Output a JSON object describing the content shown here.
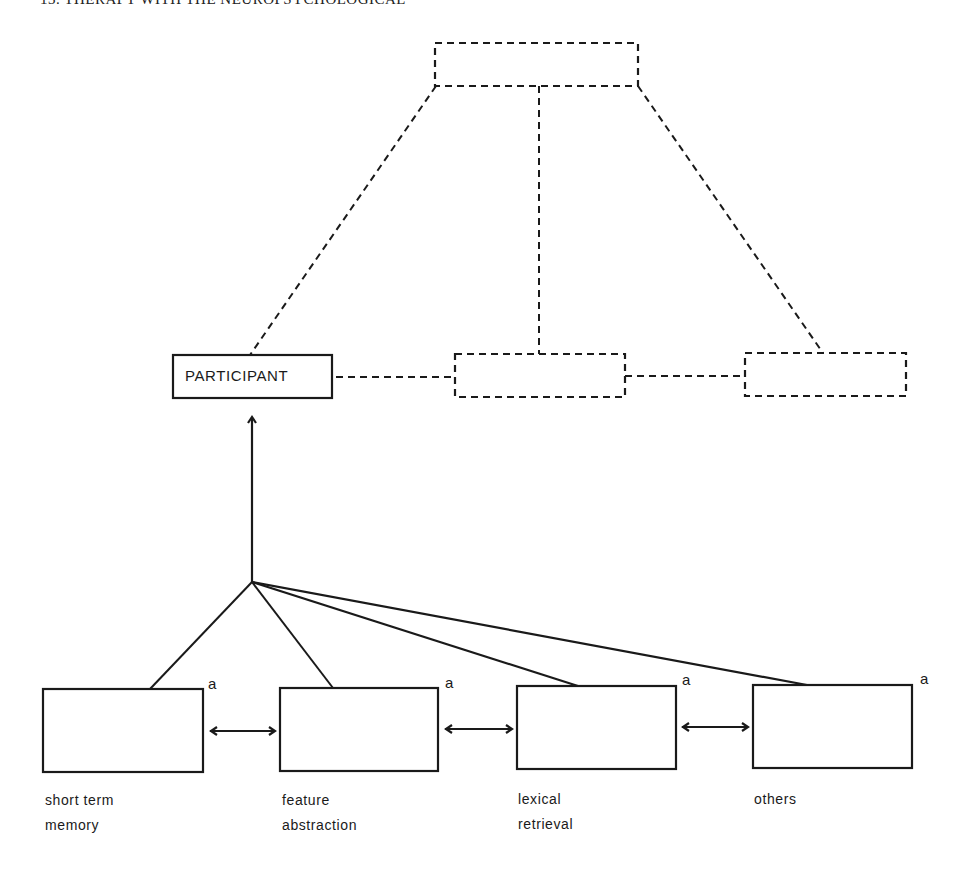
{
  "page": {
    "header_text": "13.  THERAPY WITH THE NEUROPSYCHOLOGICAL"
  },
  "diagram": {
    "top_node": {
      "label": "",
      "style": "dashed"
    },
    "middle_row": [
      {
        "label": "PARTICIPANT",
        "style": "solid"
      },
      {
        "label": "",
        "style": "dashed"
      },
      {
        "label": "",
        "style": "dashed"
      }
    ],
    "components": [
      {
        "superscript": "a",
        "caption_line1": "short term",
        "caption_line2": "memory"
      },
      {
        "superscript": "a",
        "caption_line1": "feature",
        "caption_line2": "abstraction"
      },
      {
        "superscript": "a",
        "caption_line1": "lexical",
        "caption_line2": "retrieval"
      },
      {
        "superscript": "a",
        "caption_line1": "others",
        "caption_line2": ""
      }
    ],
    "colors": {
      "line": "#1a1a1a",
      "background": "#ffffff"
    }
  }
}
